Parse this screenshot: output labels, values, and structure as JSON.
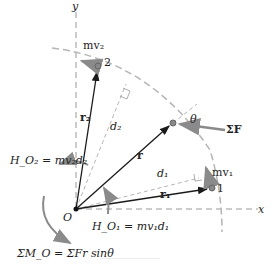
{
  "diagram": {
    "axes": {
      "x_label": "x",
      "y_label": "y",
      "origin_label": "O"
    },
    "point_1": {
      "label": "1",
      "momentum": "mv₁",
      "position": "r₁",
      "arm": "d₁"
    },
    "point_2": {
      "label": "2",
      "momentum": "mv₂",
      "position": "r₂",
      "arm": "d₂"
    },
    "general_point": {
      "position": "r",
      "angle": "θ",
      "force": "ΣF"
    },
    "equations": {
      "H_O2": "H_O₂ = mv₂d₂",
      "H_O1": "H_O₁ = mv₁d₁",
      "moment": "ΣM_O = ΣFr sinθ"
    },
    "colors": {
      "dark": "#1a1a1a",
      "gray": "#8a8a8a",
      "dashed": "#b5b5b5"
    }
  }
}
